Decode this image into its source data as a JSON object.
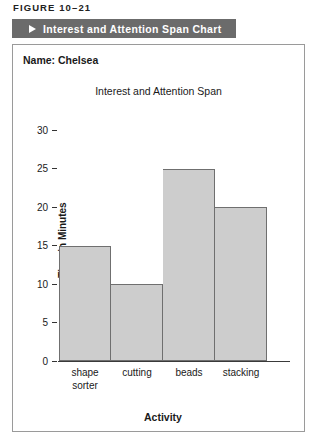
{
  "figure": {
    "caption": "FIGURE 10–21",
    "title_bar": {
      "marker_icon": "play-triangle-icon",
      "label": "Interest and Attention Span Chart",
      "background_color": "#6b6b6b",
      "text_color": "#ffffff"
    }
  },
  "panel": {
    "name_line": "Name: Chelsea"
  },
  "chart_data": {
    "type": "bar",
    "title": "Interest and Attention Span",
    "categories": [
      "shape sorter",
      "cutting",
      "beads",
      "stacking"
    ],
    "category_lines": [
      [
        "shape",
        "sorter"
      ],
      [
        "cutting"
      ],
      [
        "beads"
      ],
      [
        "stacking"
      ]
    ],
    "values": [
      15,
      10,
      25,
      20
    ],
    "xlabel": "Activity",
    "ylabel": "Time in Minutes",
    "ylim": [
      0,
      32
    ],
    "yticks": [
      30,
      25,
      20,
      15,
      10,
      5,
      0
    ],
    "grid": false,
    "legend": null,
    "bar_fill_color": "#cdcdcd",
    "bar_border_color": "#6f6f6f"
  }
}
